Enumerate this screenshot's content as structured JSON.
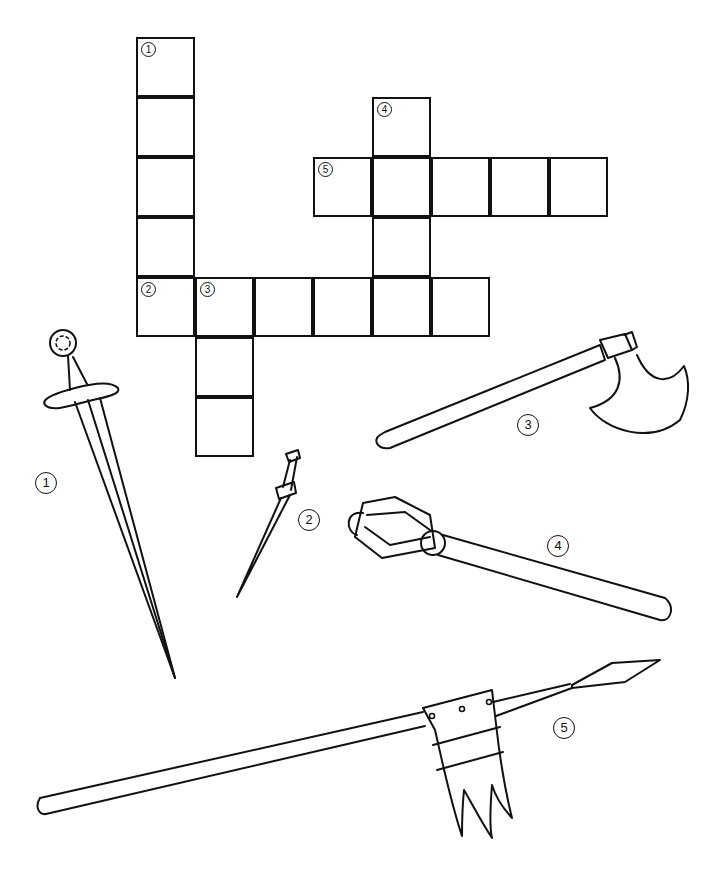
{
  "grid": {
    "cell_size": 59,
    "origin": {
      "x": 136,
      "y": 37
    },
    "cells": [
      {
        "col": 0,
        "row": 0,
        "number": "1"
      },
      {
        "col": 0,
        "row": 1
      },
      {
        "col": 0,
        "row": 2
      },
      {
        "col": 0,
        "row": 3
      },
      {
        "col": 0,
        "row": 4,
        "number": "2"
      },
      {
        "col": 1,
        "row": 4,
        "number": "3"
      },
      {
        "col": 2,
        "row": 4
      },
      {
        "col": 3,
        "row": 4
      },
      {
        "col": 4,
        "row": 4
      },
      {
        "col": 5,
        "row": 4
      },
      {
        "col": 1,
        "row": 5
      },
      {
        "col": 1,
        "row": 6
      },
      {
        "col": 4,
        "row": 1,
        "number": "4"
      },
      {
        "col": 3,
        "row": 2,
        "number": "5"
      },
      {
        "col": 4,
        "row": 2
      },
      {
        "col": 5,
        "row": 2
      },
      {
        "col": 6,
        "row": 2
      },
      {
        "col": 7,
        "row": 2
      },
      {
        "col": 4,
        "row": 3
      }
    ]
  },
  "clues": [
    {
      "number": "1",
      "picture": "sword",
      "direction": "down",
      "length": 5
    },
    {
      "number": "2",
      "picture": "dagger",
      "direction": "across",
      "length": 6
    },
    {
      "number": "3",
      "picture": "axe",
      "direction": "down",
      "length": 3
    },
    {
      "number": "4",
      "picture": "mace",
      "direction": "down",
      "length": 4
    },
    {
      "number": "5",
      "picture": "lance",
      "direction": "across",
      "length": 5
    }
  ],
  "picture_labels": [
    {
      "number": "1",
      "x": 35,
      "y": 472
    },
    {
      "number": "2",
      "x": 298,
      "y": 509
    },
    {
      "number": "3",
      "x": 517,
      "y": 414
    },
    {
      "number": "4",
      "x": 547,
      "y": 535
    },
    {
      "number": "5",
      "x": 553,
      "y": 717
    }
  ]
}
